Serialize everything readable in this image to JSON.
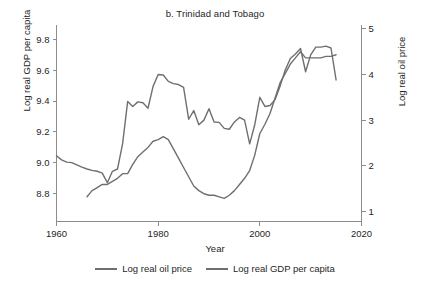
{
  "chart_data": {
    "type": "line",
    "title": "b. Trinidad and Tobago",
    "xlabel": "Year",
    "ylabel": "Log real GDP per capita",
    "ylabel_right": "Log real oil price",
    "xlim": [
      1960,
      2020
    ],
    "ylim": [
      8.62,
      9.88
    ],
    "ylim_right": [
      0.78,
      5.04
    ],
    "xticks": [
      "1960",
      "1980",
      "2000",
      "2020"
    ],
    "xtick_values": [
      1960,
      1980,
      2000,
      2020
    ],
    "yticks": [
      "8.8",
      "9.0",
      "9.2",
      "9.4",
      "9.6",
      "9.8"
    ],
    "ytick_values": [
      8.8,
      9.0,
      9.2,
      9.4,
      9.6,
      9.8
    ],
    "yticks_right": [
      "1",
      "2",
      "3",
      "4",
      "5"
    ],
    "ytick_values_right": [
      1,
      2,
      3,
      4,
      5
    ],
    "grid": false,
    "legend_position": "bottom",
    "line_color": "#6f6f6f",
    "axis_color": "#8c8c8c",
    "series": [
      {
        "name": "Log real oil price",
        "axis": "right",
        "x": [
          1960,
          1961,
          1962,
          1963,
          1964,
          1965,
          1966,
          1967,
          1968,
          1969,
          1970,
          1971,
          1972,
          1973,
          1974,
          1975,
          1976,
          1977,
          1978,
          1979,
          1980,
          1981,
          1982,
          1983,
          1984,
          1985,
          1986,
          1987,
          1988,
          1989,
          1990,
          1991,
          1992,
          1993,
          1994,
          1995,
          1996,
          1997,
          1998,
          1999,
          2000,
          2001,
          2002,
          2003,
          2004,
          2005,
          2006,
          2007,
          2008,
          2009,
          2010,
          2011,
          2012,
          2013,
          2014,
          2015
        ],
        "values": [
          2.22,
          2.13,
          2.08,
          2.07,
          2.02,
          1.97,
          1.93,
          1.9,
          1.88,
          1.84,
          1.63,
          1.88,
          1.93,
          2.48,
          3.41,
          3.3,
          3.4,
          3.38,
          3.26,
          3.74,
          4.0,
          3.99,
          3.85,
          3.8,
          3.78,
          3.72,
          3.02,
          3.21,
          2.9,
          3.0,
          3.25,
          2.96,
          2.95,
          2.82,
          2.8,
          2.96,
          3.06,
          3.0,
          2.48,
          2.9,
          3.5,
          3.3,
          3.32,
          3.45,
          3.75,
          4.1,
          4.35,
          4.45,
          4.57,
          4.06,
          4.43,
          4.6,
          4.6,
          4.62,
          4.58,
          3.88
        ]
      },
      {
        "name": "Log real GDP per capita",
        "axis": "left",
        "x": [
          1966,
          1967,
          1968,
          1969,
          1970,
          1971,
          1972,
          1973,
          1974,
          1975,
          1976,
          1977,
          1978,
          1979,
          1980,
          1981,
          1982,
          1983,
          1984,
          1985,
          1986,
          1987,
          1988,
          1989,
          1990,
          1991,
          1992,
          1993,
          1994,
          1995,
          1996,
          1997,
          1998,
          1999,
          2000,
          2001,
          2002,
          2003,
          2004,
          2005,
          2006,
          2007,
          2008,
          2009,
          2010,
          2011,
          2012,
          2013,
          2014,
          2015
        ],
        "values": [
          8.78,
          8.82,
          8.84,
          8.86,
          8.86,
          8.88,
          8.9,
          8.93,
          8.93,
          8.99,
          9.04,
          9.07,
          9.1,
          9.14,
          9.15,
          9.17,
          9.15,
          9.09,
          9.03,
          8.97,
          8.91,
          8.85,
          8.82,
          8.8,
          8.79,
          8.79,
          8.78,
          8.77,
          8.79,
          8.82,
          8.86,
          8.9,
          8.95,
          9.05,
          9.19,
          9.25,
          9.32,
          9.42,
          9.52,
          9.58,
          9.64,
          9.68,
          9.72,
          9.68,
          9.68,
          9.68,
          9.68,
          9.69,
          9.69,
          9.7
        ]
      }
    ],
    "legend": [
      {
        "label": "Log real oil price",
        "color": "#6f6f6f"
      },
      {
        "label": "Log real GDP per capita",
        "color": "#6f6f6f"
      }
    ]
  }
}
